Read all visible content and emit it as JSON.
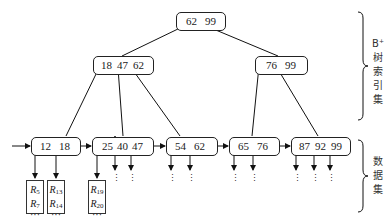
{
  "diagram": {
    "type": "B+ tree index structure",
    "root": {
      "keys": [
        "62",
        "99"
      ]
    },
    "internal_nodes": [
      {
        "id": "left",
        "keys": [
          "18",
          "47",
          "62"
        ]
      },
      {
        "id": "right",
        "keys": [
          "76",
          "99"
        ]
      }
    ],
    "leaves": [
      {
        "keys": [
          "12",
          "18"
        ]
      },
      {
        "keys": [
          "25",
          "40",
          "47"
        ]
      },
      {
        "keys": [
          "54",
          "62"
        ]
      },
      {
        "keys": [
          "65",
          "76"
        ]
      },
      {
        "keys": [
          "87",
          "92",
          "99"
        ]
      }
    ],
    "data_blocks": [
      {
        "first": "R",
        "first_sub": "5",
        "second": "R",
        "second_sub": "7",
        "ellipsis": "···",
        "last": "R",
        "last_sub": "12"
      },
      {
        "first": "R",
        "first_sub": "13",
        "second": "R",
        "second_sub": "14",
        "ellipsis": "···",
        "last": "R",
        "last_sub": "18"
      },
      {
        "first": "R",
        "first_sub": "19",
        "second": "R",
        "second_sub": "20",
        "ellipsis": "···",
        "last": "R",
        "last_sub": "25"
      }
    ],
    "vertical_ellipsis": "⋮",
    "labels": {
      "index_set": {
        "prefix": "B",
        "sup": "+",
        "chars": [
          "树",
          "索",
          "引",
          "集"
        ]
      },
      "data_set": {
        "chars": [
          "数",
          "据",
          "集"
        ]
      }
    }
  }
}
